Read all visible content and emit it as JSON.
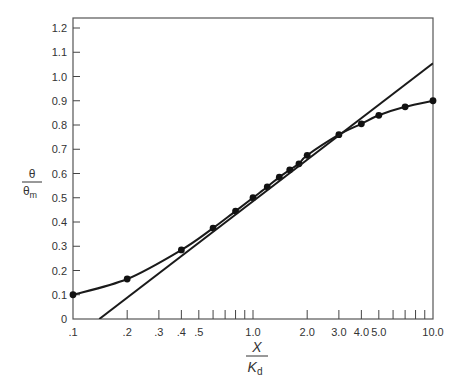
{
  "chart_data": {
    "type": "line",
    "title": "",
    "xlabel": {
      "numerator": "X",
      "denominator": "K",
      "subscript": "d"
    },
    "ylabel": {
      "numerator": "θ",
      "denominator": "θ",
      "subscript": "m"
    },
    "xscale": "log",
    "xlim": [
      0.1,
      10.0
    ],
    "ylim": [
      0,
      1.25
    ],
    "x_tick_labels": [
      {
        "value": 0.1,
        "label": ".1"
      },
      {
        "value": 0.2,
        "label": ".2"
      },
      {
        "value": 0.3,
        "label": ".3"
      },
      {
        "value": 0.4,
        "label": ".4"
      },
      {
        "value": 0.5,
        "label": ".5"
      },
      {
        "value": 1.0,
        "label": "1.0"
      },
      {
        "value": 2.0,
        "label": "2.0"
      },
      {
        "value": 3.0,
        "label": "3.0"
      },
      {
        "value": 4.0,
        "label": "4.0"
      },
      {
        "value": 5.0,
        "label": "5.0"
      },
      {
        "value": 10.0,
        "label": "10.0"
      }
    ],
    "x_minor_ticks": [
      0.2,
      0.3,
      0.4,
      0.5,
      0.6,
      0.7,
      0.8,
      0.9,
      1.0,
      2.0,
      3.0,
      4.0,
      5.0,
      6.0,
      7.0,
      8.0,
      9.0
    ],
    "y_ticks": [
      0,
      0.1,
      0.2,
      0.3,
      0.4,
      0.5,
      0.6,
      0.7,
      0.8,
      0.9,
      1.0,
      1.1,
      1.2
    ],
    "y_tick_labels": [
      "0",
      "0.1",
      "0.2",
      "0.3",
      "0.4",
      "0.5",
      "0.6",
      "0.7",
      "0.8",
      "0.9",
      "1.0",
      "1.1",
      "1.2"
    ],
    "grid": false,
    "legend": null,
    "series": [
      {
        "name": "measured (curve with points)",
        "style": "line+markers",
        "x": [
          0.1,
          0.2,
          0.4,
          0.6,
          0.8,
          1.0,
          1.2,
          1.4,
          1.6,
          1.8,
          2.0,
          3.0,
          4.0,
          5.0,
          7.0,
          10.0
        ],
        "y": [
          0.1,
          0.165,
          0.285,
          0.375,
          0.445,
          0.5,
          0.545,
          0.585,
          0.615,
          0.64,
          0.675,
          0.76,
          0.805,
          0.84,
          0.875,
          0.9
        ]
      },
      {
        "name": "linear fit",
        "style": "line",
        "x": [
          0.14,
          10.0
        ],
        "y": [
          0.0,
          1.055
        ]
      }
    ]
  }
}
